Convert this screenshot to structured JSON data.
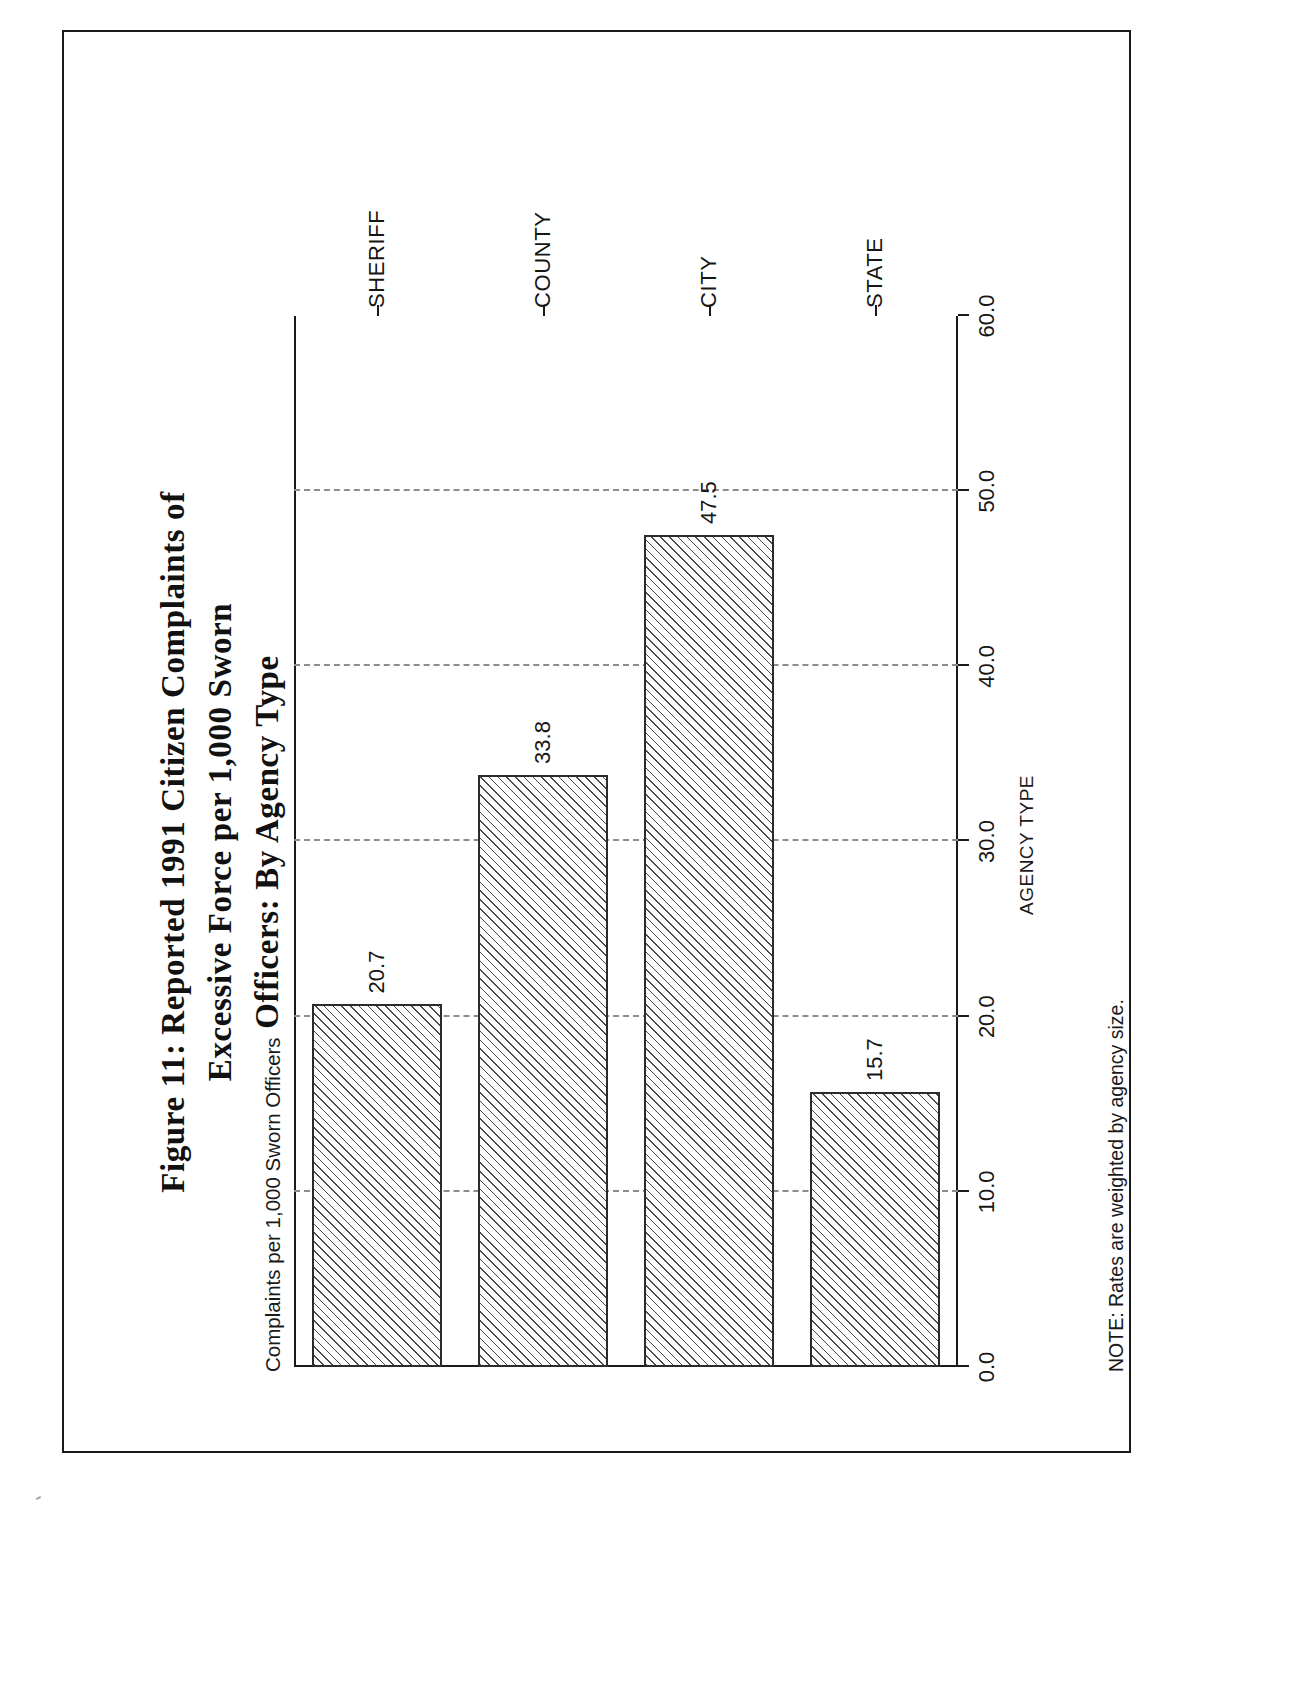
{
  "document": {
    "figure_number": "Figure 11",
    "title_lines": [
      "Figure 11: Reported 1991 Citizen Complaints of",
      "Excessive Force per 1,000 Sworn",
      "Officers: By Agency Type"
    ],
    "note": "NOTE: Rates are weighted by agency size."
  },
  "chart_data": {
    "type": "bar",
    "orientation": "vertical",
    "title": "Figure 11: Reported 1991 Citizen Complaints of Excessive Force per 1,000 Sworn Officers: By Agency Type",
    "xlabel": "AGENCY TYPE",
    "ylabel": "Complaints per 1,000 Sworn Officers",
    "categories": [
      "SHERIFF",
      "COUNTY",
      "CITY",
      "STATE"
    ],
    "values": [
      20.7,
      33.8,
      47.5,
      15.7
    ],
    "data_labels": [
      "20.7",
      "33.8",
      "47.5",
      "15.7"
    ],
    "ylim": [
      0.0,
      60.0
    ],
    "ytick_labels": [
      "0.0",
      "10.0",
      "20.0",
      "30.0",
      "40.0",
      "50.0",
      "60.0"
    ],
    "ytick_values": [
      0.0,
      10.0,
      20.0,
      30.0,
      40.0,
      50.0,
      60.0
    ],
    "grid": "dashed value gridlines at 10.0 intervals",
    "legend": "none",
    "bar_fill": "diagonal hatch",
    "colors": {
      "axis": "#1a1a1a",
      "grid": "#8d8d8d",
      "bar_outline": "#2b2b2b",
      "bar_hatch": "#4a4a4a",
      "text": "#161616",
      "page": "#ffffff"
    },
    "note": "NOTE: Rates are weighted by agency size."
  }
}
